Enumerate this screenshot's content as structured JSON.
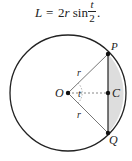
{
  "formula": {
    "lhs": "L",
    "equals": "=",
    "rhs": "2r sin",
    "rhs_coef": "2",
    "rhs_var": "r",
    "rhs_func": "sin",
    "frac_numerator": "t",
    "frac_denominator": "2",
    "terminal": "."
  },
  "diagram": {
    "labels": {
      "center": "O",
      "angle": "t",
      "radius_upper": "r",
      "radius_lower": "r",
      "point_top": "P",
      "point_mid": "C",
      "point_bottom": "Q"
    },
    "colors": {
      "stroke": "#222222",
      "radius_stroke": "#777777",
      "segment_fill": "#dddddd"
    }
  }
}
